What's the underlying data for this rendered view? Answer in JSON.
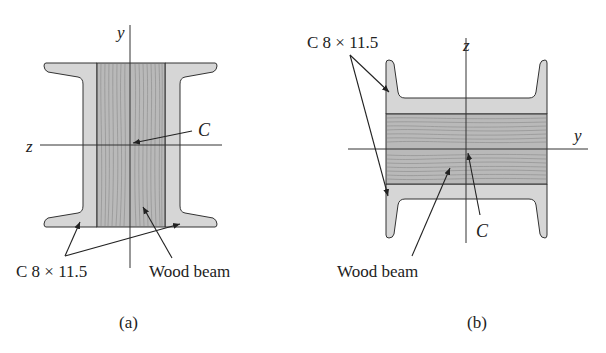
{
  "figures": [
    {
      "id": "a",
      "caption": "(a)",
      "axes": {
        "vertical": "y",
        "horizontal": "z"
      },
      "centroid_label": "C",
      "channel_label": "C 8 × 11.5",
      "wood_label": "Wood beam",
      "orientation": "channels vertical (webs on sides), wood beam between"
    },
    {
      "id": "b",
      "caption": "(b)",
      "axes": {
        "vertical": "z",
        "horizontal": "y"
      },
      "centroid_label": "C",
      "channel_label": "C 8 × 11.5",
      "wood_label": "Wood beam",
      "orientation": "channels horizontal (webs top/bottom), wood beam between"
    }
  ],
  "colors": {
    "steel_fill": "#d6d6d6",
    "wood_fill": "#b9b9b9",
    "grain": "#8a8a8a",
    "line": "#333333",
    "text": "#222222"
  }
}
